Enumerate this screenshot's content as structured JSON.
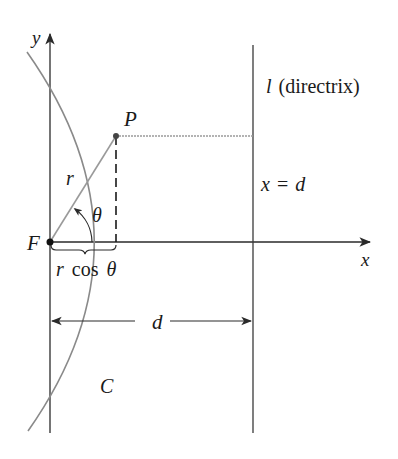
{
  "diagram": {
    "colors": {
      "axis": "#2a2a2a",
      "curve": "#8a8a8a",
      "ray": "#9a9a9a",
      "dotted": "#9a9a9a",
      "text": "#1a1a1a"
    },
    "labels": {
      "y_axis": "y",
      "x_axis": "x",
      "point_p": "P",
      "focus": "F",
      "radius": "r",
      "angle": "θ",
      "projection_r": "r",
      "projection_cos": "cos",
      "projection_theta": "θ",
      "directrix_l": "l",
      "directrix_text": "(directrix)",
      "directrix_eq_x": "x",
      "directrix_eq_sign": "=",
      "directrix_eq_d": "d",
      "distance_d": "d",
      "curve": "C"
    },
    "points": {
      "focus": {
        "x": 50,
        "y": 242
      },
      "P": {
        "x": 116,
        "y": 136
      },
      "vertex": {
        "x": 161,
        "y": 242
      }
    },
    "directrix_x": 253
  }
}
